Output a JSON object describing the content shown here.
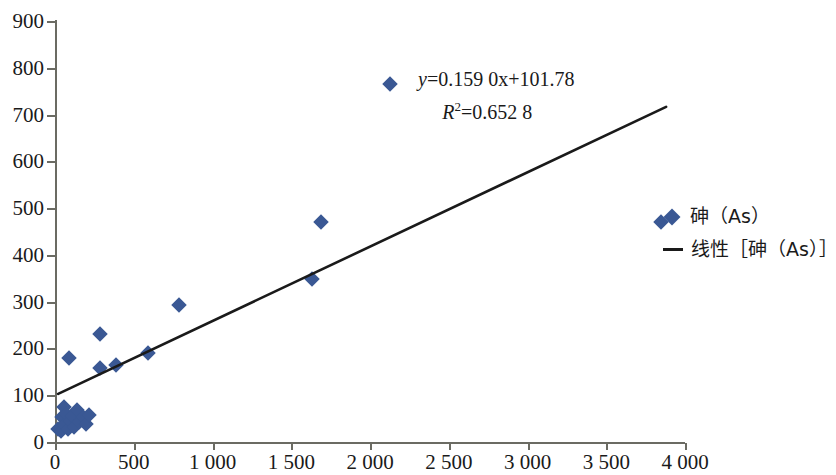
{
  "chart_data": {
    "type": "scatter",
    "title": "",
    "xlabel": "",
    "ylabel": "",
    "xlim": [
      0,
      4000
    ],
    "ylim": [
      0,
      900
    ],
    "grid": false,
    "legend_position": "right",
    "xticks": [
      "0",
      "500",
      "1 000",
      "1 500",
      "2 000",
      "2 500",
      "3 000",
      "3 500",
      "4 000"
    ],
    "xtick_values": [
      0,
      500,
      1000,
      1500,
      2000,
      2500,
      3000,
      3500,
      4000
    ],
    "yticks": [
      "0",
      "100",
      "200",
      "300",
      "400",
      "500",
      "600",
      "700",
      "800",
      "900"
    ],
    "ytick_values": [
      0,
      100,
      200,
      300,
      400,
      500,
      600,
      700,
      800,
      900
    ],
    "series": [
      {
        "name": "砷（As）",
        "marker": "diamond",
        "color": "#3a5894",
        "points": [
          [
            20,
            30
          ],
          [
            35,
            25
          ],
          [
            45,
            55
          ],
          [
            55,
            38
          ],
          [
            60,
            78
          ],
          [
            70,
            62
          ],
          [
            85,
            30
          ],
          [
            95,
            48
          ],
          [
            110,
            58
          ],
          [
            120,
            35
          ],
          [
            140,
            70
          ],
          [
            155,
            45
          ],
          [
            175,
            55
          ],
          [
            195,
            40
          ],
          [
            215,
            60
          ],
          [
            90,
            182
          ],
          [
            285,
            233
          ],
          [
            285,
            160
          ],
          [
            390,
            167
          ],
          [
            590,
            193
          ],
          [
            790,
            295
          ],
          [
            1630,
            350
          ],
          [
            1690,
            472
          ],
          [
            2130,
            768
          ],
          [
            3850,
            473
          ]
        ]
      }
    ],
    "trendline": {
      "name": "线性［砷（As）］",
      "color": "#1a1a1a",
      "slope": 0.159,
      "intercept": 101.78,
      "r_squared": 0.6528,
      "x_start": 20,
      "x_end": 3880
    },
    "annotations": {
      "equation": "y=0.159 0x+101.78",
      "equation_y_var": "y",
      "equation_rest": "=0.159 0x+101.78",
      "r2_var": "R",
      "r2_sup": "2",
      "r2_rest": "=0.652 8",
      "r2_text": "R²=0.652 8"
    },
    "legend": [
      {
        "label": "砷（As）",
        "marker": "diamond",
        "color": "#3a5894"
      },
      {
        "label": "线性［砷（As）］",
        "marker": "line",
        "color": "#1a1a1a"
      }
    ]
  },
  "colors": {
    "marker": "#3a5894",
    "trendline": "#1a1a1a",
    "axis": "#6b6b63",
    "background": "#ffffff"
  }
}
